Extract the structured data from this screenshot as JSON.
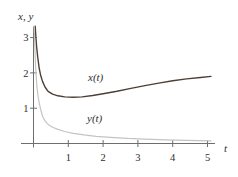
{
  "chart_data": {
    "type": "line",
    "title": "",
    "xlabel": "t",
    "ylabel": "x, y",
    "xlim": [
      0,
      5.3
    ],
    "ylim": [
      0,
      3.35
    ],
    "grid": false,
    "legend_position": "inline-labels",
    "x_ticks": [
      1,
      2,
      3,
      4,
      5
    ],
    "y_ticks": [
      1,
      2,
      3
    ],
    "axis_color": "#6e6e6e",
    "series": [
      {
        "name": "x(t)",
        "color": "#4d3f38",
        "points": [
          [
            0.05,
            3.32
          ],
          [
            0.07,
            3.0
          ],
          [
            0.09,
            2.75
          ],
          [
            0.12,
            2.45
          ],
          [
            0.16,
            2.15
          ],
          [
            0.2,
            1.95
          ],
          [
            0.26,
            1.76
          ],
          [
            0.33,
            1.6
          ],
          [
            0.42,
            1.48
          ],
          [
            0.55,
            1.4
          ],
          [
            0.7,
            1.35
          ],
          [
            0.9,
            1.32
          ],
          [
            1.15,
            1.31
          ],
          [
            1.4,
            1.32
          ],
          [
            1.7,
            1.36
          ],
          [
            2.0,
            1.41
          ],
          [
            2.4,
            1.48
          ],
          [
            2.8,
            1.56
          ],
          [
            3.2,
            1.64
          ],
          [
            3.6,
            1.71
          ],
          [
            4.0,
            1.78
          ],
          [
            4.4,
            1.83
          ],
          [
            4.8,
            1.87
          ],
          [
            5.1,
            1.9
          ]
        ]
      },
      {
        "name": "y(t)",
        "color": "#c4c4c2",
        "points": [
          [
            0.02,
            3.3
          ],
          [
            0.04,
            2.7
          ],
          [
            0.06,
            2.2
          ],
          [
            0.08,
            1.85
          ],
          [
            0.1,
            1.6
          ],
          [
            0.13,
            1.35
          ],
          [
            0.16,
            1.17
          ],
          [
            0.2,
            0.98
          ],
          [
            0.26,
            0.78
          ],
          [
            0.33,
            0.64
          ],
          [
            0.42,
            0.54
          ],
          [
            0.55,
            0.46
          ],
          [
            0.7,
            0.4
          ],
          [
            0.9,
            0.34
          ],
          [
            1.15,
            0.29
          ],
          [
            1.45,
            0.245
          ],
          [
            1.8,
            0.205
          ],
          [
            2.2,
            0.175
          ],
          [
            2.7,
            0.145
          ],
          [
            3.2,
            0.125
          ],
          [
            3.8,
            0.105
          ],
          [
            4.4,
            0.09
          ],
          [
            5.1,
            0.075
          ]
        ]
      }
    ]
  }
}
